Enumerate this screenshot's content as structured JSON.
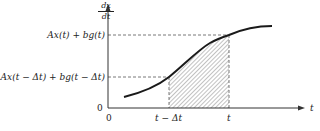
{
  "diagram": {
    "y_axis_label": {
      "numerator": "dx",
      "denominator": "dt"
    },
    "x_axis_label": "t",
    "y_ticks": {
      "upper": "Ax(t) + bg(t)",
      "lower": "Ax(t − Δt) + bg(t − Δt)",
      "origin": "0"
    },
    "x_ticks": {
      "origin": "0",
      "left_bound": "t − Δt",
      "right_bound": "t"
    },
    "shaded_region": "area under curve between t − Δt and t (hatched)",
    "colors": {
      "line": "#222222",
      "hatch": "#555555",
      "dash": "#444444"
    }
  }
}
